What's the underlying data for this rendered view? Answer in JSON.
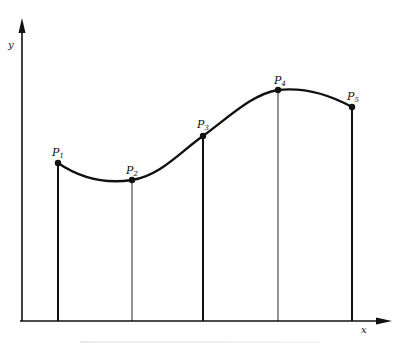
{
  "diagram": {
    "axes": {
      "x_label": "x",
      "y_label": "y",
      "origin": [
        22,
        321
      ],
      "x_end": 390,
      "y_end": 20
    },
    "points": [
      {
        "label": "P",
        "sub": "1",
        "x": 58,
        "y": 163,
        "ordinate": "thick"
      },
      {
        "label": "P",
        "sub": "2",
        "x": 132,
        "y": 180,
        "ordinate": "thin"
      },
      {
        "label": "P",
        "sub": "3",
        "x": 203,
        "y": 136,
        "ordinate": "thick"
      },
      {
        "label": "P",
        "sub": "4",
        "x": 278,
        "y": 90,
        "ordinate": "thin"
      },
      {
        "label": "P",
        "sub": "5",
        "x": 352,
        "y": 107,
        "ordinate": "thick"
      }
    ],
    "curve": "smooth curve through P1..P5",
    "colors": {
      "ink": "#111111",
      "background": "#ffffff"
    }
  }
}
